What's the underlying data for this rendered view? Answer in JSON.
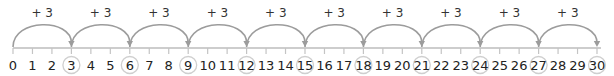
{
  "number_line": {
    "start": 0,
    "end": 30,
    "step": 1,
    "jump_size": 3,
    "jump_label": "+ 3",
    "jumps": [
      {
        "from": 0,
        "to": 3,
        "label": "+ 3"
      },
      {
        "from": 3,
        "to": 6,
        "label": "+ 3"
      },
      {
        "from": 6,
        "to": 9,
        "label": "+ 3"
      },
      {
        "from": 9,
        "to": 12,
        "label": "+ 3"
      },
      {
        "from": 12,
        "to": 15,
        "label": "+ 3"
      },
      {
        "from": 15,
        "to": 18,
        "label": "+ 3"
      },
      {
        "from": 18,
        "to": 21,
        "label": "+ 3"
      },
      {
        "from": 21,
        "to": 24,
        "label": "+ 3"
      },
      {
        "from": 24,
        "to": 27,
        "label": "+ 3"
      },
      {
        "from": 27,
        "to": 30,
        "label": "+ 3"
      }
    ],
    "tick_labels": [
      "0",
      "1",
      "2",
      "3",
      "4",
      "5",
      "6",
      "7",
      "8",
      "9",
      "10",
      "11",
      "12",
      "13",
      "14",
      "15",
      "16",
      "17",
      "18",
      "19",
      "20",
      "21",
      "22",
      "23",
      "24",
      "25",
      "26",
      "27",
      "28",
      "29",
      "30"
    ],
    "circled": [
      3,
      6,
      9,
      12,
      15,
      18,
      21,
      24,
      27,
      30
    ]
  },
  "colors": {
    "arc": "#9c9c9c",
    "axis": "#bcbcbc",
    "tick": "#c4c4c4",
    "circle": "#cfcfcf",
    "text": "#222222"
  }
}
